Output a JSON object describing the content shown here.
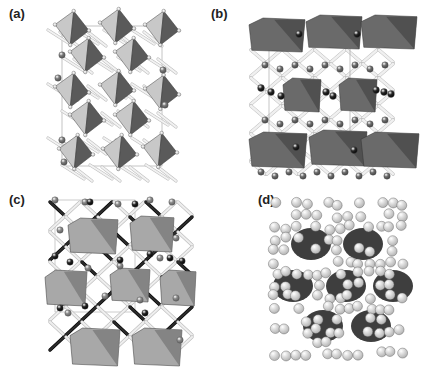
{
  "figure": {
    "panels": [
      {
        "id": "a",
        "label": "(a)",
        "style": "tilted-octahedra",
        "polyhedron_light": "#c8c8c8",
        "polyhedron_dark": "#5a5a5a",
        "atom_color": "#7a7a7a",
        "small_atom_color": "#e8e8e8"
      },
      {
        "id": "b",
        "label": "(b)",
        "style": "layered-octahedra",
        "polyhedron_light": "#6a6a6a",
        "polyhedron_dark": "#4a4a4a",
        "atom_color": "#6e6e6e",
        "dark_atom_color": "#2a2a2a",
        "small_atom_color": "#eeeeee"
      },
      {
        "id": "c",
        "label": "(c)",
        "style": "mixed-framework",
        "polyhedron_light": "#a8a8a8",
        "polyhedron_dark": "#7a7a7a",
        "atom_color": "#8a8a8a",
        "dark_atom_color": "#262626",
        "small_atom_color": "#f0f0f0"
      },
      {
        "id": "d",
        "label": "(d)",
        "style": "space-filling",
        "polyhedron_dark": "#3e3e3e",
        "atom_color": "#dcdcdc"
      }
    ]
  }
}
